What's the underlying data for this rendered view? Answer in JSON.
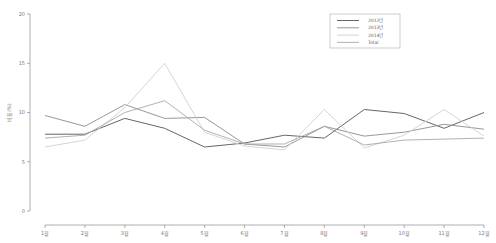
{
  "chart_data": {
    "type": "line",
    "title": "",
    "xlabel": "",
    "ylabel": "비율(%)",
    "ylim": [
      0,
      20
    ],
    "yticks": [
      0,
      5,
      10,
      15,
      20
    ],
    "grid": false,
    "legend_position": "top-right",
    "categories": [
      "1월",
      "2월",
      "3월",
      "4월",
      "5월",
      "6월",
      "7월",
      "8월",
      "9월",
      "10월",
      "11월",
      "12월"
    ],
    "series": [
      {
        "name": "2012년",
        "color": "#555555",
        "values": [
          7.8,
          7.8,
          9.4,
          8.4,
          6.5,
          6.9,
          7.7,
          7.4,
          10.3,
          9.9,
          8.4,
          10.0
        ]
      },
      {
        "name": "2013년",
        "color": "#8c8c8c",
        "values": [
          9.7,
          8.6,
          10.8,
          9.4,
          9.5,
          6.8,
          6.5,
          8.6,
          7.6,
          8.0,
          8.8,
          8.3
        ]
      },
      {
        "name": "2014년",
        "color": "#d0d0d0",
        "values": [
          6.5,
          7.2,
          10.5,
          15.0,
          8.0,
          6.6,
          6.2,
          10.3,
          6.4,
          7.7,
          10.3,
          7.6
        ]
      },
      {
        "name": "Total",
        "color": "#a8a8a8",
        "values": [
          7.4,
          7.7,
          10.0,
          11.2,
          8.2,
          6.8,
          6.8,
          8.6,
          6.7,
          7.2,
          7.3,
          7.4
        ]
      }
    ]
  }
}
